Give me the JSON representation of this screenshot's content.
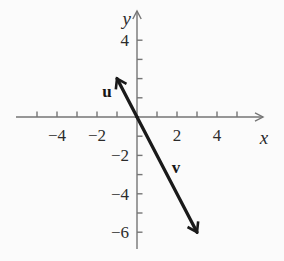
{
  "diagram": {
    "type": "vector-plot",
    "background": "#fbfbfb",
    "axis_color": "#757575",
    "vector_color": "#1a1a1a",
    "text_color": "#2b2b2b",
    "x_axis": {
      "label": "x",
      "ticks": [
        -5,
        -4,
        -3,
        -2,
        -1,
        1,
        2,
        3,
        4,
        5
      ],
      "tick_labels": [
        {
          "value": -4,
          "text": "−4"
        },
        {
          "value": -2,
          "text": "−2"
        },
        {
          "value": 2,
          "text": "2"
        },
        {
          "value": 4,
          "text": "4"
        }
      ]
    },
    "y_axis": {
      "label": "y",
      "ticks": [
        -6,
        -5,
        -4,
        -3,
        -2,
        -1,
        1,
        2,
        3,
        4
      ],
      "tick_labels": [
        {
          "value": 4,
          "text": "4"
        },
        {
          "value": -2,
          "text": "−2"
        },
        {
          "value": -4,
          "text": "−4"
        },
        {
          "value": -6,
          "text": "−6"
        }
      ]
    },
    "vectors": [
      {
        "name": "u",
        "label": "u",
        "from": [
          0,
          0
        ],
        "to": [
          -1,
          2
        ]
      },
      {
        "name": "v",
        "label": "v",
        "from": [
          0,
          0
        ],
        "to": [
          3,
          -6
        ]
      }
    ]
  }
}
